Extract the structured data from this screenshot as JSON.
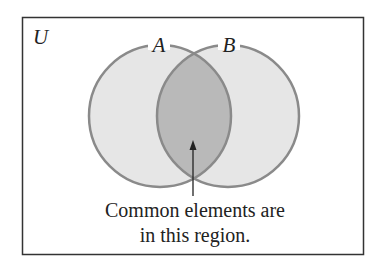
{
  "diagram": {
    "type": "venn",
    "universe_label": "U",
    "sets": [
      {
        "label": "A",
        "cx": 160,
        "cy": 116,
        "r": 71
      },
      {
        "label": "B",
        "cx": 228,
        "cy": 116,
        "r": 71
      }
    ],
    "caption_lines": [
      "Common elements are",
      "in this region."
    ],
    "colors": {
      "border": "#333333",
      "circle_fill": "#e6e6e6",
      "circle_stroke": "#8a8a8a",
      "intersection_fill": "#b9b9b9"
    }
  }
}
